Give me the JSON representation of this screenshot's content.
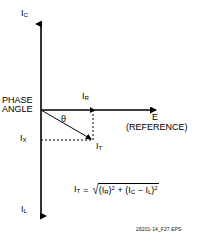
{
  "figure": {
    "type": "phasor-diagram",
    "caption": "26201-14_F27.EPS",
    "axes": {
      "vertical_top_label": "I",
      "vertical_top_sub": "C",
      "vertical_bottom_label": "I",
      "vertical_bottom_sub": "L",
      "horizontal_label": "E",
      "horizontal_sub_label": "(REFERENCE)"
    },
    "annotations": {
      "phase_angle_line1": "PHASE",
      "phase_angle_line2": "ANGLE",
      "theta": "θ",
      "ix_label": "I",
      "ix_sub": "X",
      "ir_label": "I",
      "ir_sub": "R",
      "it_label": "I",
      "it_sub": "T"
    },
    "formula": {
      "lhs": "I",
      "lhs_sub": "T",
      "equals": "=",
      "radical_sign": "√",
      "term1_open": "(I",
      "term1_sub": "R",
      "term1_close": ")",
      "term1_exp": "2",
      "plus": "+",
      "term2_open": "(I",
      "term2_sub_c": "C",
      "minus": "−",
      "term2_i": "I",
      "term2_sub_l": "L",
      "term2_close": ")",
      "term2_exp": "2"
    },
    "colors": {
      "stroke": "#000000",
      "background": "#ffffff",
      "dashed": "#000000"
    },
    "geometry": {
      "origin_x": 41,
      "origin_y": 110,
      "v_axis_top_y": 22,
      "v_axis_bottom_y": 218,
      "h_axis_end_x": 158,
      "ir_tip_x": 93,
      "it_tip_x": 93,
      "it_tip_y": 140
    }
  }
}
